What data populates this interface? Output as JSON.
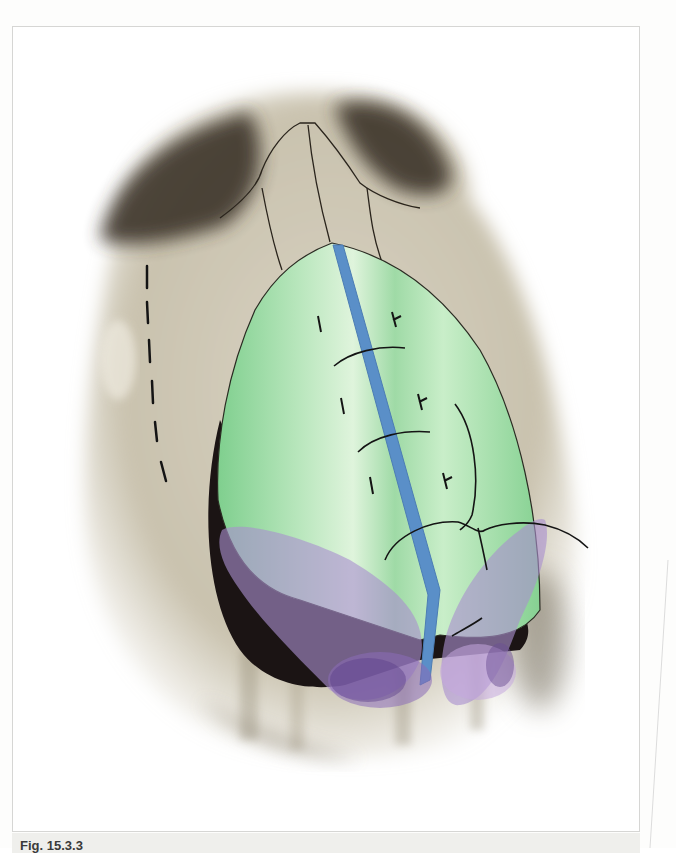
{
  "figure": {
    "caption_visible_start": "Fig. 15.3.3",
    "colors": {
      "skin": "#cfc8b6",
      "skin_shadow": "#4a4236",
      "graft_green": "#9ed9a6",
      "graft_highlight": "#d6f2d6",
      "strut_blue": "#5a8fc8",
      "cartilage_purple": "#a98fcf",
      "cartilage_dark": "#6b4f94",
      "suture_black": "#1a1a1a",
      "frame_border": "#d6d6d4",
      "caption_band": "#efefec"
    },
    "elements": {
      "nasal_bones_outline": "nasal bones with suture lines",
      "dorsal_graft": "green leaf-shaped onlay graft",
      "columellar_strut": "blue midline strut",
      "lateral_crura": "purple alar cartilage lobes",
      "dashed_line": "osteotomy marking (dashed)",
      "sutures": "curved suture lines with knots"
    }
  }
}
